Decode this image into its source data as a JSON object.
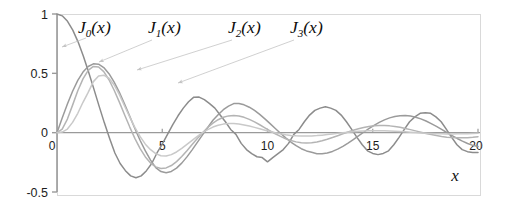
{
  "chart_data": {
    "type": "line",
    "title": "",
    "subtitle": "",
    "xlabel": "x",
    "ylabel": "",
    "xlim": [
      0,
      20
    ],
    "ylim": [
      -0.5,
      1
    ],
    "grid": false,
    "legend_position": "inline-annotations",
    "x_ticks": [
      0,
      5,
      10,
      15,
      20
    ],
    "x_tick_labels": [
      "0",
      "5",
      "10",
      "15",
      "20"
    ],
    "y_ticks": [
      1,
      0.5,
      0,
      -0.5
    ],
    "y_tick_labels": [
      "1",
      "0.5",
      "0",
      "-0.5"
    ],
    "frame": true,
    "zero_line": true,
    "annotations": [
      {
        "text_base": "J",
        "sub": "0",
        "tail": "(x)",
        "label": "J_0(x)"
      },
      {
        "text_base": "J",
        "sub": "1",
        "tail": "(x)",
        "label": "J_1(x)"
      },
      {
        "text_base": "J",
        "sub": "2",
        "tail": "(x)",
        "label": "J_2(x)"
      },
      {
        "text_base": "J",
        "sub": "3",
        "tail": "(x)",
        "label": "J_3(x)"
      }
    ],
    "series": [
      {
        "name": "J_0(x)",
        "order": 0,
        "color": "#8c8c8c",
        "label_x": 78,
        "label_y": 33,
        "leader_from": [
          86,
          38
        ],
        "leader_to": [
          62,
          47
        ],
        "values": [
          1.0,
          0.9844,
          0.9385,
          0.8642,
          0.7652,
          0.6459,
          0.5118,
          0.369,
          0.2239,
          0.0827,
          -0.0484,
          -0.1712,
          -0.2601,
          -0.3202,
          -0.3643,
          -0.3801,
          -0.3643,
          -0.3202,
          -0.2601,
          -0.1712,
          -0.0968,
          -0.0142,
          0.0677,
          0.1424,
          0.2069,
          0.2601,
          0.2991,
          0.3001,
          0.2786,
          0.2453,
          0.2069,
          0.1483,
          0.0917,
          0.0271,
          -0.0142,
          -0.0903,
          -0.1424,
          -0.1768,
          -0.2028,
          -0.2097,
          -0.2459,
          -0.2097,
          -0.1768,
          -0.1424,
          -0.0903,
          -0.0142,
          0.0271,
          0.0917,
          0.1483,
          0.1881,
          0.2069,
          0.2183,
          0.2069,
          0.1881,
          0.1483,
          0.0917,
          0.0271,
          -0.0392,
          -0.1022,
          -0.1528,
          -0.175,
          -0.185,
          -0.175,
          -0.1528,
          -0.1022,
          -0.0392,
          0.0271,
          0.0917,
          0.133,
          0.1626,
          0.167,
          0.1626,
          0.133,
          0.0917,
          0.0271,
          -0.0392,
          -0.1022,
          -0.143,
          -0.16,
          -0.167,
          -0.167
        ]
      },
      {
        "name": "J_1(x)",
        "order": 1,
        "color": "#9b9b9b",
        "label_x": 148,
        "label_y": 33,
        "leader_from": [
          152,
          40
        ],
        "leader_to": [
          99,
          62
        ],
        "values": [
          0.0,
          0.124,
          0.2423,
          0.3492,
          0.4401,
          0.5106,
          0.5579,
          0.5802,
          0.5767,
          0.5484,
          0.4971,
          0.426,
          0.3391,
          0.2411,
          0.1374,
          0.0335,
          -0.066,
          -0.1538,
          -0.2311,
          -0.2951,
          -0.3276,
          -0.3371,
          -0.3264,
          -0.2985,
          -0.2566,
          -0.2041,
          -0.1446,
          -0.0817,
          -0.0184,
          0.0435,
          0.1043,
          0.1514,
          0.1934,
          0.2238,
          0.2453,
          0.2453,
          0.2346,
          0.2146,
          0.1871,
          0.1538,
          0.1164,
          0.0765,
          0.0357,
          -0.0047,
          -0.0435,
          -0.0789,
          -0.1096,
          -0.135,
          -0.1538,
          -0.1655,
          -0.1768,
          -0.1768,
          -0.1711,
          -0.158,
          -0.139,
          -0.1151,
          -0.0876,
          -0.0578,
          -0.0271,
          0.0035,
          0.0334,
          0.0613,
          0.0863,
          0.1077,
          0.1247,
          0.1368,
          0.1434,
          0.1446,
          0.1402,
          0.1306,
          0.1164,
          0.0981,
          0.0765,
          0.0526,
          0.0271,
          0.0012,
          -0.0244,
          -0.0489,
          -0.0713,
          -0.0908,
          -0.1067,
          -0.1165
        ]
      },
      {
        "name": "J_2(x)",
        "order": 2,
        "color": "#b4b4b4",
        "label_x": 228,
        "label_y": 33,
        "leader_from": [
          232,
          40
        ],
        "leader_to": [
          137,
          70
        ],
        "values": [
          0.0,
          0.0306,
          0.1149,
          0.2321,
          0.3528,
          0.4536,
          0.5242,
          0.5579,
          0.5537,
          0.514,
          0.4461,
          0.3578,
          0.2571,
          0.1514,
          0.0471,
          -0.05,
          -0.1351,
          -0.2045,
          -0.2559,
          -0.2882,
          -0.3014,
          -0.2969,
          -0.2769,
          -0.2438,
          -0.201,
          -0.152,
          -0.1001,
          -0.0486,
          0.0,
          0.0435,
          0.0803,
          0.1092,
          0.1297,
          0.1415,
          0.1448,
          0.1404,
          0.1291,
          0.1121,
          0.0908,
          0.0665,
          0.0409,
          0.0153,
          -0.0092,
          -0.0316,
          -0.0509,
          -0.0664,
          -0.0776,
          -0.0843,
          -0.0864,
          -0.0841,
          -0.0779,
          -0.0682,
          -0.0557,
          -0.0412,
          -0.0256,
          -0.0097,
          0.0057,
          0.0202,
          0.033,
          0.0437,
          0.052,
          0.0575,
          0.0602,
          0.0601,
          0.0573,
          0.0521,
          0.0448,
          0.0359,
          0.0258,
          0.0151,
          0.0043,
          -0.0062,
          -0.016,
          -0.0247,
          -0.032,
          -0.0377,
          -0.0415,
          -0.0434,
          -0.0435,
          -0.0418,
          -0.0385,
          -0.0339
        ]
      },
      {
        "name": "J_3(x)",
        "order": 3,
        "color": "#c9c9c9",
        "label_x": 290,
        "label_y": 33,
        "leader_from": [
          294,
          40
        ],
        "leader_to": [
          178,
          83
        ],
        "values": [
          0.0,
          0.0052,
          0.0306,
          0.0865,
          0.1633,
          0.2561,
          0.3391,
          0.4302,
          0.4777,
          0.4847,
          0.4586,
          0.4016,
          0.3209,
          0.225,
          0.132,
          0.043,
          -0.0337,
          -0.0967,
          -0.1432,
          -0.1768,
          -0.1947,
          -0.1967,
          -0.1851,
          -0.1626,
          -0.1329,
          -0.0991,
          -0.0642,
          -0.0307,
          0.0,
          0.0262,
          0.0472,
          0.0624,
          0.0721,
          0.0766,
          0.0764,
          0.0723,
          0.0651,
          0.0556,
          0.0446,
          0.0329,
          0.0211,
          0.0097,
          -0.0007,
          -0.0098,
          -0.0173,
          -0.023,
          -0.0268,
          -0.0287,
          -0.0288,
          -0.0274,
          -0.0246,
          -0.0208,
          -0.0162,
          -0.0111,
          -0.0059,
          -0.0007,
          0.0041,
          0.0083,
          0.0118,
          0.0145,
          0.0162,
          0.017,
          0.0169,
          0.016,
          0.0144,
          0.0122,
          0.0096,
          0.0067,
          0.0038,
          0.0008,
          -0.002,
          -0.0045,
          -0.0066,
          -0.0083,
          -0.0095,
          -0.0102,
          -0.0104,
          -0.0101,
          -0.0094,
          -0.0083,
          -0.0069,
          -0.0053
        ]
      }
    ]
  },
  "axes": {
    "frame_color": "#d9d9d9",
    "axis_color": "#9a9a9a",
    "tick_color": "#9a9a9a",
    "zero_line_color": "#9a9a9a",
    "leader_color": "#c4c4c4"
  }
}
